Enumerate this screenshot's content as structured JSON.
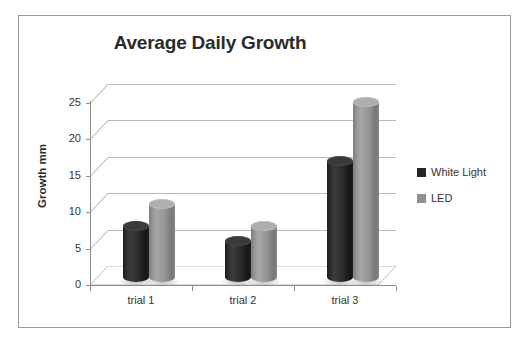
{
  "chart_data": {
    "type": "bar",
    "title": "Average Daily Growth",
    "xlabel": "",
    "ylabel": "Growth mm",
    "categories": [
      "trial 1",
      "trial 2",
      "trial 3"
    ],
    "series": [
      {
        "name": "White Light",
        "color": "#262626",
        "values": [
          7,
          5,
          16
        ]
      },
      {
        "name": "LED",
        "color": "#8f8f8f",
        "values": [
          10,
          7,
          24
        ]
      }
    ],
    "ylim": [
      0,
      25
    ],
    "yticks": [
      0,
      5,
      10,
      15,
      20,
      25
    ],
    "ytick_labels": [
      "0",
      "5",
      "10",
      "15",
      "20",
      "25"
    ],
    "grid": true,
    "grid_axis": "y",
    "legend_position": "right",
    "style": "3d-cylinder",
    "background": "#ffffff",
    "frame_color": "#9a9a9a",
    "grid_color": "#b9b9b9",
    "axis_color": "#8d8d8d",
    "text_color": "#333333",
    "title_color": "#2b2b2b"
  },
  "top_remnant": ""
}
